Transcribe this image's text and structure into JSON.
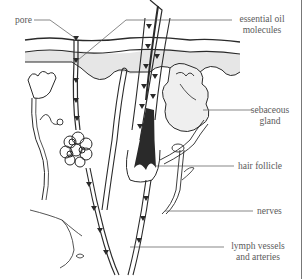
{
  "diagram": {
    "labels": {
      "pore": "pore",
      "essential_oil_1": "essential oil",
      "essential_oil_2": "molecules",
      "sebaceous_1": "sebaceous",
      "sebaceous_2": "gland",
      "hair_follicle": "hair follicle",
      "nerves": "nerves",
      "lymph_1": "lymph vessels",
      "lymph_2": "and arteries"
    },
    "colors": {
      "ink": "#2a2a2a",
      "dermis_shade": "#e6e6e6",
      "label_text": "#5a5a5a"
    }
  }
}
